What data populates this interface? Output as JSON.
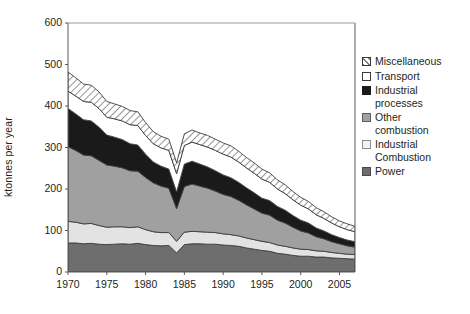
{
  "chart_data": {
    "type": "area",
    "title": "",
    "xlabel": "",
    "ylabel": "ktonnes per year",
    "xlim": [
      1970,
      2007
    ],
    "ylim": [
      0,
      600
    ],
    "ytick_values": [
      0,
      100,
      200,
      300,
      400,
      500,
      600
    ],
    "xtick_values": [
      1970,
      1975,
      1980,
      1985,
      1990,
      1995,
      2000,
      2005
    ],
    "ytick_labels": [
      "0",
      "100",
      "200",
      "300",
      "400",
      "500",
      "600"
    ],
    "xtick_labels": [
      "1970",
      "1975",
      "1980",
      "1985",
      "1990",
      "1995",
      "2000",
      "2005"
    ],
    "grid": false,
    "stacked": true,
    "legend_position": "right",
    "x": [
      1970,
      1971,
      1972,
      1973,
      1974,
      1975,
      1976,
      1977,
      1978,
      1979,
      1980,
      1981,
      1982,
      1983,
      1984,
      1985,
      1986,
      1987,
      1988,
      1989,
      1990,
      1991,
      1992,
      1993,
      1994,
      1995,
      1996,
      1997,
      1998,
      1999,
      2000,
      2001,
      2002,
      2003,
      2004,
      2005,
      2006,
      2007
    ],
    "series": [
      {
        "name": "Power",
        "fill": "#6e6e6e",
        "pattern": "solid",
        "values": [
          70,
          70,
          68,
          69,
          67,
          66,
          67,
          68,
          67,
          69,
          66,
          64,
          63,
          64,
          46,
          66,
          68,
          68,
          67,
          67,
          65,
          64,
          62,
          58,
          55,
          52,
          50,
          45,
          43,
          40,
          38,
          38,
          36,
          36,
          34,
          33,
          32,
          31
        ]
      },
      {
        "name": "Industrial Combustion",
        "fill": "#e3e3e3",
        "pattern": "solid",
        "values": [
          52,
          50,
          48,
          48,
          45,
          42,
          42,
          41,
          40,
          40,
          36,
          33,
          32,
          31,
          28,
          30,
          30,
          29,
          29,
          28,
          27,
          26,
          25,
          24,
          23,
          22,
          21,
          20,
          19,
          18,
          17,
          16,
          15,
          14,
          13,
          12,
          11,
          11
        ]
      },
      {
        "name": "Other combustion",
        "fill": "#a0a0a0",
        "pattern": "solid",
        "values": [
          180,
          173,
          166,
          163,
          157,
          150,
          146,
          142,
          137,
          134,
          126,
          118,
          112,
          107,
          79,
          110,
          114,
          110,
          106,
          100,
          95,
          92,
          86,
          80,
          74,
          68,
          66,
          60,
          56,
          50,
          44,
          40,
          34,
          30,
          26,
          23,
          20,
          18
        ]
      },
      {
        "name": "Industrial processes",
        "fill": "#1a1a1a",
        "pattern": "solid",
        "values": [
          92,
          88,
          85,
          84,
          80,
          72,
          70,
          68,
          65,
          63,
          56,
          50,
          48,
          46,
          40,
          54,
          55,
          53,
          51,
          49,
          47,
          45,
          43,
          41,
          39,
          36,
          35,
          33,
          31,
          28,
          26,
          24,
          21,
          19,
          17,
          15,
          14,
          13
        ]
      },
      {
        "name": "Transport",
        "fill": "#ffffff",
        "pattern": "solid",
        "values": [
          42,
          43,
          44,
          45,
          45,
          43,
          44,
          45,
          46,
          47,
          45,
          44,
          44,
          45,
          44,
          45,
          46,
          47,
          48,
          49,
          50,
          50,
          49,
          48,
          47,
          46,
          44,
          42,
          40,
          38,
          36,
          34,
          32,
          30,
          28,
          26,
          25,
          24
        ]
      },
      {
        "name": "Miscellaneous",
        "fill": "hatch",
        "pattern": "diagonal-hatch",
        "values": [
          46,
          44,
          42,
          41,
          40,
          38,
          36,
          35,
          34,
          33,
          31,
          29,
          28,
          27,
          26,
          28,
          29,
          28,
          28,
          27,
          27,
          27,
          26,
          25,
          25,
          24,
          23,
          22,
          21,
          20,
          19,
          18,
          17,
          16,
          15,
          14,
          14,
          13
        ]
      }
    ]
  },
  "legend": {
    "items": [
      {
        "label": "Miscellaneous",
        "swatch": "hatch"
      },
      {
        "label": "Transport",
        "swatch": "white"
      },
      {
        "label": "Industrial\nprocesses",
        "swatch": "black"
      },
      {
        "label": "Other\ncombustion",
        "swatch": "gray"
      },
      {
        "label": "Industrial\nCombustion",
        "swatch": "lightgray"
      },
      {
        "label": "Power",
        "swatch": "darkgray"
      }
    ]
  },
  "colors": {
    "power": "#6e6e6e",
    "industrial_combustion": "#e3e3e3",
    "other_combustion": "#a0a0a0",
    "industrial_processes": "#1a1a1a",
    "transport": "#ffffff",
    "axis": "#58585a",
    "text": "#231f20"
  }
}
